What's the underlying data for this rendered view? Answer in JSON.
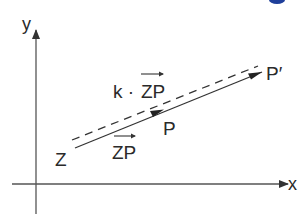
{
  "diagram": {
    "axes": {
      "x_label": "x",
      "y_label": "y"
    },
    "points": {
      "Z": "Z",
      "P": "P",
      "P_prime": "P′"
    },
    "vectors": {
      "ZP": {
        "label_prefix": "",
        "label": "ZP"
      },
      "kZP": {
        "label_prefix": "k ·",
        "label": "ZP"
      }
    },
    "colors": {
      "line": "#2a2a2a",
      "axis": "#555555",
      "accent_blue": "#1f3f9a"
    }
  }
}
